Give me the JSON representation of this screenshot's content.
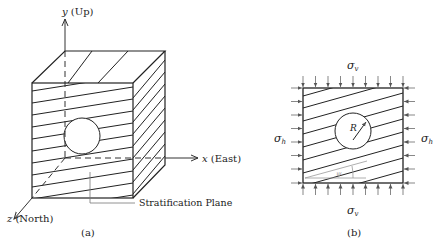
{
  "panel_a": {
    "caption": "(a)",
    "y_axis_var": "y",
    "y_axis_dir": "(Up)",
    "x_axis_var": "x",
    "x_axis_dir": "(East)",
    "z_axis_var": "z",
    "z_axis_dir": "(North)",
    "stratification_label": "Stratification Plane"
  },
  "panel_b": {
    "caption": "(b)",
    "sigma_v_top": "σ",
    "sigma_v_top_sub": "v",
    "sigma_v_bottom": "σ",
    "sigma_v_bottom_sub": "v",
    "sigma_h_left": "σ",
    "sigma_h_left_sub": "h",
    "sigma_h_right": "σ",
    "sigma_h_right_sub": "h",
    "radius_label": "R",
    "angle_label": "ψ"
  },
  "colors": {
    "stroke": "#222222",
    "grey": "#999999"
  }
}
